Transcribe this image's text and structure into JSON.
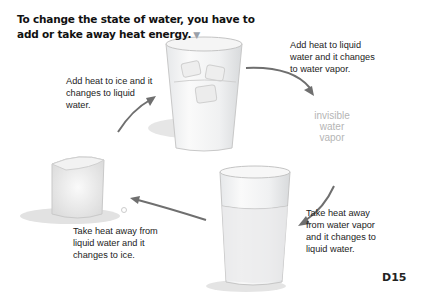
{
  "title": {
    "text": "To change the state of water, you have to add or take away heat energy.",
    "marker": "▼"
  },
  "stages": {
    "ice_to_liquid": "Add heat to ice and it changes to liquid water.",
    "liquid_to_vapor": "Add heat to liquid water and it changes to water vapor.",
    "vapor": "invisible water vapor",
    "vapor_to_liquid": "Take heat away from water vapor and it changes to liquid water.",
    "liquid_to_ice": "Take heat away from liquid water and it changes to ice."
  },
  "illustrations": [
    "glass-with-ice-icon",
    "glass-of-water-icon",
    "ice-cube-icon"
  ],
  "colors": {
    "arrow": "#6f6f6f",
    "marker": "#9aa0a8",
    "vapor_text": "#b5b5b5"
  },
  "page_number": "D15"
}
